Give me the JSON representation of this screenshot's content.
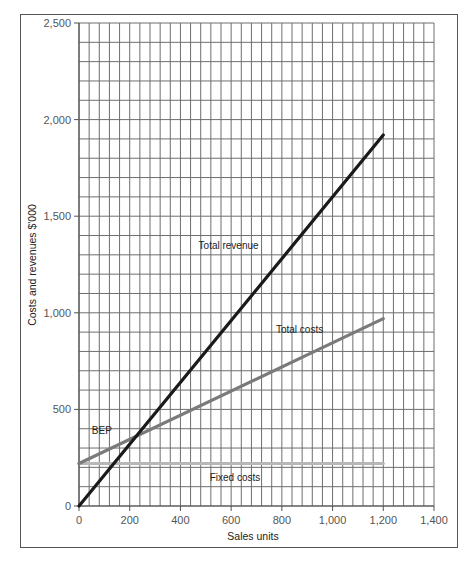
{
  "chart_data": {
    "type": "line",
    "title": "",
    "xlabel": "Sales units",
    "ylabel": "Costs and revenues $'000",
    "xlim": [
      0,
      1400
    ],
    "ylim": [
      0,
      2500
    ],
    "x_ticks": [
      0,
      200,
      400,
      600,
      800,
      1000,
      1200,
      1400
    ],
    "x_tick_labels": [
      "0",
      "200",
      "400",
      "600",
      "800",
      "1,000",
      "1,200",
      "1,400"
    ],
    "y_ticks": [
      0,
      500,
      1000,
      1500,
      2000,
      2500
    ],
    "y_tick_labels": [
      "0",
      "500",
      "1,000",
      "1,500",
      "2,000",
      "2,500"
    ],
    "grid": true,
    "grid_x_step": 40,
    "grid_y_step": 100,
    "legend": "none (inline labels)",
    "series": [
      {
        "name": "Total revenue",
        "x": [
          0,
          1200
        ],
        "values": [
          0,
          1920
        ],
        "color": "#1a1a1a",
        "width": 3.2
      },
      {
        "name": "Total costs",
        "x": [
          0,
          1200
        ],
        "values": [
          220,
          970
        ],
        "color": "#7a7a7a",
        "width": 3.2
      },
      {
        "name": "Fixed costs",
        "x": [
          0,
          1200
        ],
        "values": [
          220,
          220
        ],
        "color": "#b8b8b8",
        "width": 3.2
      }
    ],
    "annotations": [
      {
        "text": "Total revenue",
        "x": 590,
        "y": 1330
      },
      {
        "text": "Total costs",
        "x": 870,
        "y": 895
      },
      {
        "text": "BEP",
        "x": 90,
        "y": 375
      },
      {
        "text": "Fixed costs",
        "x": 615,
        "y": 130
      }
    ],
    "break_even_point": {
      "units": 225,
      "value": 360
    }
  }
}
